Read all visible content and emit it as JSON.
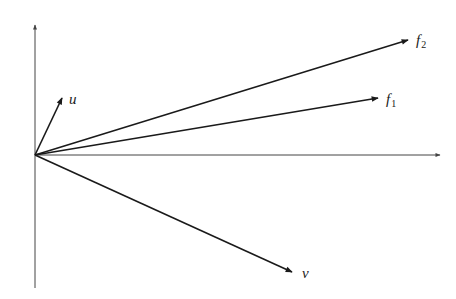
{
  "diagram": {
    "type": "vector-diagram",
    "stroke_color": "#1a1a1a",
    "axis_color": "#444444",
    "origin": [
      35,
      155
    ],
    "axes": {
      "x_axis": {
        "from": [
          35,
          155
        ],
        "to": [
          440,
          155
        ]
      },
      "y_axis": {
        "from": [
          35,
          288
        ],
        "to": [
          35,
          25
        ]
      }
    },
    "vectors": [
      {
        "id": "u",
        "label": "u",
        "subscript": "",
        "tip": [
          62,
          98
        ]
      },
      {
        "id": "f2",
        "label": "f",
        "subscript": "2",
        "tip": [
          408,
          40
        ]
      },
      {
        "id": "f1",
        "label": "f",
        "subscript": "1",
        "tip": [
          378,
          98
        ]
      },
      {
        "id": "v",
        "label": "v",
        "subscript": "",
        "tip": [
          292,
          272
        ]
      }
    ]
  }
}
